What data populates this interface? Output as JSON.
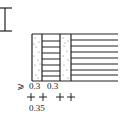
{
  "diagram": {
    "type": "wall-section-detail",
    "colors": {
      "stroke": "#222222",
      "background": "#ffffff"
    },
    "labels": {
      "min_symbol": "⩾",
      "dim1": "0.3",
      "dim2": "0.3",
      "dim_total": "0.35"
    },
    "layers": [
      {
        "name": "dotted-column-1",
        "fill": "stipple"
      },
      {
        "name": "hatched-band-1",
        "fill": "horizontal-lines"
      },
      {
        "name": "dotted-column-2",
        "fill": "stipple"
      },
      {
        "name": "hatched-band-2",
        "fill": "horizontal-lines"
      }
    ]
  }
}
